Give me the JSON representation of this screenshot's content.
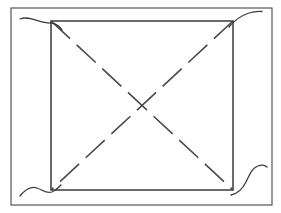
{
  "figure": {
    "kind": "line-drawing",
    "canvas": {
      "width": 281,
      "height": 213,
      "background_color": "#ffffff"
    },
    "colors": {
      "outer_border": "#555555",
      "inner_rect": "#3a3a3a",
      "diagonal": "#4a4a4a",
      "flourish": "#3d3d3d",
      "background": "#ffffff"
    },
    "outer_border": {
      "label": "outer frame",
      "x": 11,
      "y": 8,
      "width": 261,
      "height": 197,
      "stroke_width": 1.2
    },
    "inner_rect": {
      "label": "inner rectangle",
      "x": 51,
      "y": 21,
      "width": 182,
      "height": 169,
      "stroke_width": 1.5
    },
    "diagonals": {
      "label": "dashed diagonals",
      "crossing_point": {
        "x": 142,
        "y": 105
      },
      "dash_length": 26,
      "gap_length": 9,
      "stroke_width": 1.6,
      "lines": [
        {
          "name": "diagonal-tl-br",
          "x1": 51,
          "y1": 21,
          "x2": 233,
          "y2": 190
        },
        {
          "name": "diagonal-tr-bl",
          "x1": 233,
          "y1": 21,
          "x2": 51,
          "y2": 190
        }
      ]
    },
    "flourishes": [
      {
        "name": "flourish-top-left",
        "corner": "top-left",
        "path": "M 20 19 C 30 15 40 24 52 23 C 56 23.5 59 26 62 30",
        "stroke_width": 1.3
      },
      {
        "name": "flourish-top-right",
        "corner": "top-right",
        "path": "M 229 27 C 233 22 240 16 249 13 C 254 11.5 258 11 262 11.5",
        "stroke_width": 1.3
      },
      {
        "name": "flourish-bottom-left",
        "corner": "bottom-left",
        "path": "M 20 196 C 25 190 31 186 37 188 C 43 190 46 194 52 192 C 56 190.5 58 188 61 185",
        "stroke_width": 1.3
      },
      {
        "name": "flourish-bottom-right",
        "corner": "bottom-right",
        "path": "M 231 195 C 236 194 242 190 246 182 C 250 174 252 168 258 166 C 262 164.5 265 165 267 167",
        "stroke_width": 1.3
      }
    ]
  }
}
